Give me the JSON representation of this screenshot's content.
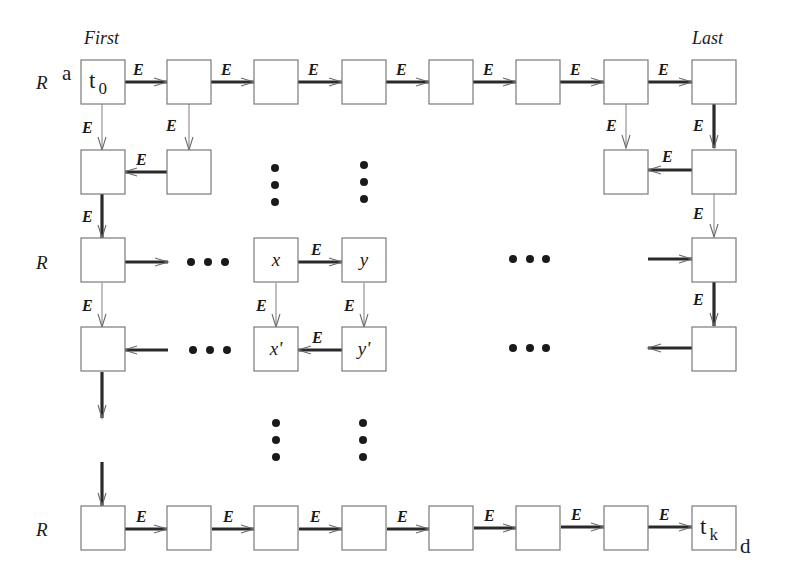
{
  "diagram": {
    "row_label": "R",
    "edge_label": "E",
    "header_first": "First",
    "header_last": "Last",
    "corner_start": "a",
    "corner_end": "d",
    "start_cell": {
      "base": "t",
      "sub": "0"
    },
    "end_cell": {
      "base": "t",
      "sub": "k"
    },
    "cell_x": "x",
    "cell_y": "y",
    "cell_x_prime": "x'",
    "cell_y_prime": "y'",
    "box_size": 44,
    "columns_x": [
      81,
      167,
      254,
      342,
      429,
      516,
      604,
      692
    ],
    "rows_y": [
      60,
      150,
      238,
      327,
      506
    ],
    "row_labels_y": [
      81,
      262,
      529
    ],
    "boxes": [
      {
        "col": 0,
        "row": 0,
        "text": "t0"
      },
      {
        "col": 1,
        "row": 0
      },
      {
        "col": 2,
        "row": 0
      },
      {
        "col": 3,
        "row": 0
      },
      {
        "col": 4,
        "row": 0
      },
      {
        "col": 5,
        "row": 0
      },
      {
        "col": 6,
        "row": 0
      },
      {
        "col": 7,
        "row": 0
      },
      {
        "col": 0,
        "row": 1
      },
      {
        "col": 1,
        "row": 1
      },
      {
        "col": 6,
        "row": 1
      },
      {
        "col": 7,
        "row": 1
      },
      {
        "col": 0,
        "row": 2
      },
      {
        "col": 2,
        "row": 2,
        "text": "x"
      },
      {
        "col": 3,
        "row": 2,
        "text": "y"
      },
      {
        "col": 7,
        "row": 2
      },
      {
        "col": 0,
        "row": 3
      },
      {
        "col": 2,
        "row": 3,
        "text": "x'"
      },
      {
        "col": 3,
        "row": 3,
        "text": "y'"
      },
      {
        "col": 7,
        "row": 3
      },
      {
        "col": 0,
        "row": 4
      },
      {
        "col": 1,
        "row": 4
      },
      {
        "col": 2,
        "row": 4
      },
      {
        "col": 3,
        "row": 4
      },
      {
        "col": 4,
        "row": 4
      },
      {
        "col": 5,
        "row": 4
      },
      {
        "col": 6,
        "row": 4
      },
      {
        "col": 7,
        "row": 4,
        "text": "tk"
      }
    ],
    "edges": [
      {
        "x1": 124,
        "y1": 82,
        "x2": 167,
        "y2": 82,
        "w": "thick",
        "label": "E",
        "lx": 133,
        "ly": 75
      },
      {
        "x1": 211,
        "y1": 82,
        "x2": 254,
        "y2": 82,
        "w": "thick",
        "label": "E",
        "lx": 221,
        "ly": 75
      },
      {
        "x1": 298,
        "y1": 82,
        "x2": 342,
        "y2": 82,
        "w": "thick",
        "label": "E",
        "lx": 308,
        "ly": 75
      },
      {
        "x1": 386,
        "y1": 82,
        "x2": 429,
        "y2": 82,
        "w": "thick",
        "label": "E",
        "lx": 396,
        "ly": 75
      },
      {
        "x1": 473,
        "y1": 82,
        "x2": 516,
        "y2": 82,
        "w": "thick",
        "label": "E",
        "lx": 483,
        "ly": 75
      },
      {
        "x1": 560,
        "y1": 82,
        "x2": 604,
        "y2": 82,
        "w": "thick",
        "label": "E",
        "lx": 570,
        "ly": 75
      },
      {
        "x1": 648,
        "y1": 82,
        "x2": 692,
        "y2": 82,
        "w": "thick",
        "label": "E",
        "lx": 658,
        "ly": 75
      },
      {
        "x1": 102,
        "y1": 104,
        "x2": 102,
        "y2": 150,
        "w": "thin",
        "label": "E",
        "lx": 82,
        "ly": 133
      },
      {
        "x1": 189,
        "y1": 104,
        "x2": 189,
        "y2": 150,
        "w": "thin",
        "label": "E",
        "lx": 166,
        "ly": 131
      },
      {
        "x1": 626,
        "y1": 104,
        "x2": 626,
        "y2": 148,
        "w": "thin",
        "label": "E",
        "lx": 606,
        "ly": 131
      },
      {
        "x1": 714,
        "y1": 104,
        "x2": 714,
        "y2": 148,
        "w": "thick",
        "label": "E",
        "lx": 693,
        "ly": 131
      },
      {
        "x1": 167,
        "y1": 172,
        "x2": 124,
        "y2": 172,
        "w": "thick",
        "label": "E",
        "lx": 136,
        "ly": 165
      },
      {
        "x1": 604,
        "y1": 170,
        "x2": 648,
        "y2": 170,
        "w": "thick",
        "label": "E",
        "lx": 662,
        "ly": 162,
        "dir": "left",
        "from": 692,
        "to": 648
      },
      {
        "x1": 102,
        "y1": 194,
        "x2": 102,
        "y2": 238,
        "w": "thick",
        "label": "E",
        "lx": 82,
        "ly": 222
      },
      {
        "x1": 714,
        "y1": 192,
        "x2": 714,
        "y2": 237,
        "w": "thin",
        "label": "E",
        "lx": 693,
        "ly": 219
      },
      {
        "x1": 124,
        "y1": 262,
        "x2": 168,
        "y2": 262,
        "w": "thick"
      },
      {
        "x1": 298,
        "y1": 262,
        "x2": 342,
        "y2": 262,
        "w": "thick",
        "label": "E",
        "lx": 311,
        "ly": 255
      },
      {
        "x1": 648,
        "y1": 259,
        "x2": 692,
        "y2": 259,
        "w": "thick"
      },
      {
        "x1": 102,
        "y1": 283,
        "x2": 102,
        "y2": 327,
        "w": "thin",
        "label": "E",
        "lx": 82,
        "ly": 311
      },
      {
        "x1": 276,
        "y1": 283,
        "x2": 276,
        "y2": 327,
        "w": "thin",
        "label": "E",
        "lx": 256,
        "ly": 311
      },
      {
        "x1": 364,
        "y1": 283,
        "x2": 364,
        "y2": 327,
        "w": "thin",
        "label": "E",
        "lx": 344,
        "ly": 311
      },
      {
        "x1": 714,
        "y1": 282,
        "x2": 714,
        "y2": 326,
        "w": "thick",
        "label": "E",
        "lx": 693,
        "ly": 305
      },
      {
        "x1": 168,
        "y1": 350,
        "x2": 124,
        "y2": 350,
        "w": "thick"
      },
      {
        "x1": 342,
        "y1": 350,
        "x2": 298,
        "y2": 350,
        "w": "thick",
        "label": "E",
        "lx": 312,
        "ly": 343
      },
      {
        "x1": 692,
        "y1": 348,
        "x2": 648,
        "y2": 348,
        "w": "thick"
      },
      {
        "x1": 102,
        "y1": 372,
        "x2": 102,
        "y2": 418,
        "w": "thick"
      },
      {
        "x1": 102,
        "y1": 462,
        "x2": 102,
        "y2": 506,
        "w": "thick"
      },
      {
        "x1": 125,
        "y1": 529,
        "x2": 167,
        "y2": 529,
        "w": "thick",
        "label": "E",
        "lx": 136,
        "ly": 522
      },
      {
        "x1": 212,
        "y1": 529,
        "x2": 254,
        "y2": 529,
        "w": "thick",
        "label": "E",
        "lx": 223,
        "ly": 522
      },
      {
        "x1": 299,
        "y1": 529,
        "x2": 342,
        "y2": 529,
        "w": "thick",
        "label": "E",
        "lx": 310,
        "ly": 522
      },
      {
        "x1": 387,
        "y1": 529,
        "x2": 429,
        "y2": 529,
        "w": "thick",
        "label": "E",
        "lx": 397,
        "ly": 522
      },
      {
        "x1": 474,
        "y1": 528,
        "x2": 516,
        "y2": 528,
        "w": "thick",
        "label": "E",
        "lx": 484,
        "ly": 521
      },
      {
        "x1": 561,
        "y1": 527,
        "x2": 604,
        "y2": 527,
        "w": "thick",
        "label": "E",
        "lx": 571,
        "ly": 520
      },
      {
        "x1": 648,
        "y1": 527,
        "x2": 692,
        "y2": 527,
        "w": "thick",
        "label": "E",
        "lx": 659,
        "ly": 520
      }
    ],
    "dots": [
      {
        "x": 275,
        "y": 168
      },
      {
        "x": 275,
        "y": 185
      },
      {
        "x": 275,
        "y": 202
      },
      {
        "x": 364,
        "y": 165
      },
      {
        "x": 364,
        "y": 182
      },
      {
        "x": 364,
        "y": 199
      },
      {
        "x": 191,
        "y": 262
      },
      {
        "x": 208,
        "y": 262
      },
      {
        "x": 225,
        "y": 262
      },
      {
        "x": 513,
        "y": 259
      },
      {
        "x": 530,
        "y": 259
      },
      {
        "x": 546,
        "y": 259
      },
      {
        "x": 193,
        "y": 350
      },
      {
        "x": 210,
        "y": 350
      },
      {
        "x": 227,
        "y": 350
      },
      {
        "x": 513,
        "y": 348
      },
      {
        "x": 530,
        "y": 348
      },
      {
        "x": 546,
        "y": 348
      },
      {
        "x": 276,
        "y": 423
      },
      {
        "x": 276,
        "y": 440
      },
      {
        "x": 276,
        "y": 457
      },
      {
        "x": 363,
        "y": 423
      },
      {
        "x": 363,
        "y": 440
      },
      {
        "x": 363,
        "y": 457
      }
    ]
  }
}
